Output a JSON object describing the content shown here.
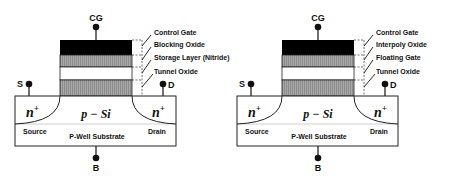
{
  "diagrams": [
    {
      "name": "charge-trap-flash-cell",
      "terminals": {
        "gate": "CG",
        "source": "S",
        "drain": "D",
        "body": "B"
      },
      "layers": [
        {
          "label": "Control Gate",
          "fill": "#000000"
        },
        {
          "label": "Blocking Oxide",
          "fill": "#9a9a9a"
        },
        {
          "label": "Storage Layer (Nitride)",
          "fill": "#ffffff"
        },
        {
          "label": "Tunnel Oxide",
          "fill": "#9a9a9a"
        }
      ],
      "regions": {
        "source_doping": "n",
        "source_sup": "+",
        "drain_doping": "n",
        "drain_sup": "+",
        "channel": "p − Si",
        "source_label": "Source",
        "drain_label": "Drain",
        "substrate_label": "P-Well Substrate"
      }
    },
    {
      "name": "floating-gate-flash-cell",
      "terminals": {
        "gate": "CG",
        "source": "S",
        "drain": "D",
        "body": "B"
      },
      "layers": [
        {
          "label": "Control Gate",
          "fill": "#000000"
        },
        {
          "label": "Interpoly Oxide",
          "fill": "#9a9a9a"
        },
        {
          "label": "Floating Gate",
          "fill": "#ffffff"
        },
        {
          "label": "Tunnel Oxide",
          "fill": "#9a9a9a"
        }
      ],
      "regions": {
        "source_doping": "n",
        "source_sup": "+",
        "drain_doping": "n",
        "drain_sup": "+",
        "channel": "p − Si",
        "source_label": "Source",
        "drain_label": "Drain",
        "substrate_label": "P-Well Substrate"
      }
    }
  ],
  "colors": {
    "stroke": "#222222",
    "hatch_gray": "#9a9a9a",
    "gate_black": "#000000"
  }
}
